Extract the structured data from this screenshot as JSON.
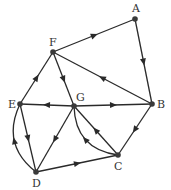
{
  "diagram": {
    "type": "directed-graph",
    "nodes": [
      {
        "id": "A",
        "label": "A",
        "x": 135,
        "y": 19,
        "lx": 132,
        "ly": 12
      },
      {
        "id": "B",
        "label": "B",
        "x": 152,
        "y": 104,
        "lx": 157,
        "ly": 108
      },
      {
        "id": "C",
        "label": "C",
        "x": 118,
        "y": 155,
        "lx": 114,
        "ly": 170
      },
      {
        "id": "D",
        "label": "D",
        "x": 36,
        "y": 172,
        "lx": 32,
        "ly": 187
      },
      {
        "id": "E",
        "label": "E",
        "x": 20,
        "y": 104,
        "lx": 8,
        "ly": 108
      },
      {
        "id": "F",
        "label": "F",
        "x": 53,
        "y": 52,
        "lx": 49,
        "ly": 46
      },
      {
        "id": "G",
        "label": "G",
        "x": 74,
        "y": 106,
        "lx": 76,
        "ly": 101
      }
    ],
    "edges": [
      {
        "from": "F",
        "to": "A",
        "curve": 0
      },
      {
        "from": "A",
        "to": "B",
        "curve": 0
      },
      {
        "from": "B",
        "to": "F",
        "curve": 0
      },
      {
        "from": "F",
        "to": "G",
        "curve": 0
      },
      {
        "from": "E",
        "to": "F",
        "curve": 0
      },
      {
        "from": "G",
        "to": "E",
        "curve": 0
      },
      {
        "from": "G",
        "to": "B",
        "curve": 0
      },
      {
        "from": "B",
        "to": "C",
        "curve": 0
      },
      {
        "from": "C",
        "to": "G",
        "curve": 0
      },
      {
        "from": "C",
        "to": "G",
        "curve": -14
      },
      {
        "from": "G",
        "to": "D",
        "curve": 0
      },
      {
        "from": "E",
        "to": "D",
        "curve": 0
      },
      {
        "from": "D",
        "to": "E",
        "curve": -14
      },
      {
        "from": "D",
        "to": "C",
        "curve": 0
      }
    ]
  }
}
